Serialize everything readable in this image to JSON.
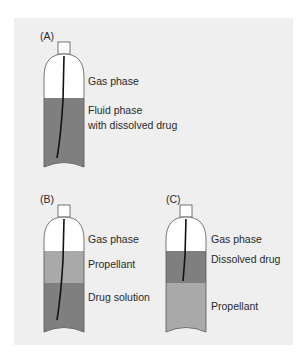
{
  "diagram": {
    "colors": {
      "background_panel": "#efefef",
      "gas": "#ffffff",
      "fluid_dark": "#7f7f7f",
      "propellant_light": "#a9a9a9",
      "outline": "#555555",
      "dip_tube": "#111111"
    },
    "canisters": [
      {
        "id": "A",
        "tag": "(A)",
        "layers": [
          {
            "name": "gas",
            "label": "Gas phase"
          },
          {
            "name": "fluid",
            "label_line1": "Fluid phase",
            "label_line2": "with dissolved drug"
          }
        ]
      },
      {
        "id": "B",
        "tag": "(B)",
        "layers": [
          {
            "name": "gas",
            "label": "Gas phase"
          },
          {
            "name": "propellant",
            "label": "Propellant"
          },
          {
            "name": "drug-solution",
            "label": "Drug solution"
          }
        ]
      },
      {
        "id": "C",
        "tag": "(C)",
        "layers": [
          {
            "name": "gas",
            "label": "Gas phase"
          },
          {
            "name": "dissolved-drug",
            "label": "Dissolved drug"
          },
          {
            "name": "propellant",
            "label": "Propellant"
          }
        ]
      }
    ]
  }
}
